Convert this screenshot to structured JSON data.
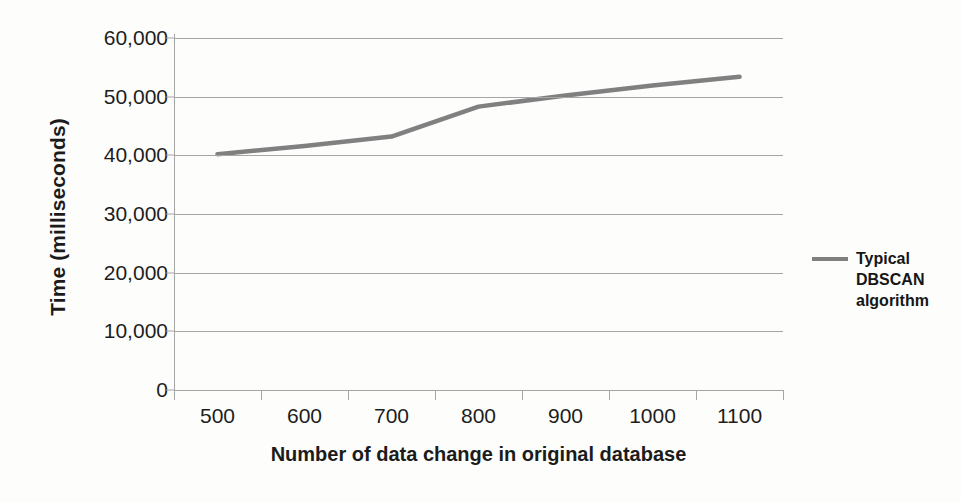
{
  "chart_data": {
    "type": "line",
    "title": "",
    "xlabel": "Number of data change in original database",
    "ylabel": "Time (milliseconds)",
    "categories": [
      "500",
      "600",
      "700",
      "800",
      "900",
      "1000",
      "1100"
    ],
    "x": [
      500,
      600,
      700,
      800,
      900,
      1000,
      1100
    ],
    "series": [
      {
        "name": "Typical DBSCAN algorithm",
        "values": [
          40200,
          41600,
          43200,
          48300,
          50200,
          51900,
          53400
        ],
        "color": "#808080"
      }
    ],
    "ylim": [
      0,
      60000
    ],
    "ytick_labels": [
      "60,000",
      "50,000",
      "40,000",
      "30,000",
      "20,000",
      "10,000",
      "0"
    ],
    "ytick_values": [
      60000,
      50000,
      40000,
      30000,
      20000,
      10000,
      0
    ],
    "grid": "horizontal",
    "legend_position": "right",
    "legend_entries": [
      "Typical DBSCAN algorithm"
    ],
    "legend_lines": [
      "Typical",
      "DBSCAN",
      "algorithm"
    ],
    "background_color": "#fdfdfc",
    "gridline_color": "#a6a6a6",
    "text_color": "#1d1d1d"
  }
}
